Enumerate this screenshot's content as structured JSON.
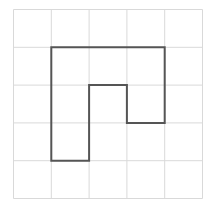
{
  "grid": {
    "rows": 5,
    "cols": 5,
    "origin_x": 13.5,
    "origin_y": 9.5,
    "cell_size": 37.8,
    "line_color": "#d9d9d9",
    "line_width": 1
  },
  "shape": {
    "name": "polyomino-outline",
    "stroke_color": "#555555",
    "stroke_width": 2,
    "vertices_grid_units": [
      [
        1,
        1
      ],
      [
        4,
        1
      ],
      [
        4,
        3
      ],
      [
        3,
        3
      ],
      [
        3,
        2
      ],
      [
        2,
        2
      ],
      [
        2,
        4
      ],
      [
        1,
        4
      ]
    ]
  },
  "colors": {
    "background": "#ffffff"
  }
}
